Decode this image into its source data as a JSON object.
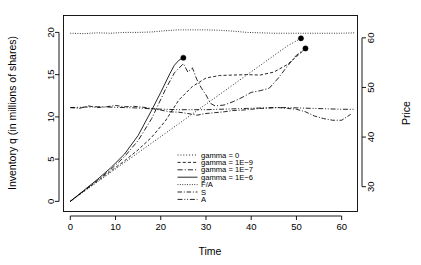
{
  "chart_data": {
    "type": "line",
    "title": "",
    "xlabel": "Time",
    "ylabel": "Inventory q (in millions of shares)",
    "y2label": "Price",
    "xlim": [
      -1.5,
      63.5
    ],
    "ylim": [
      -1.2,
      22.0
    ],
    "y2lim": [
      25.0,
      64.5
    ],
    "xticks": [
      0,
      10,
      20,
      30,
      40,
      50,
      60
    ],
    "yticks": [
      0,
      5,
      10,
      15,
      20
    ],
    "y2ticks": [
      30,
      40,
      50,
      60
    ],
    "grid": false,
    "legend_position": "center",
    "series": [
      {
        "name": "gamma = 0",
        "label": "gamma = 0",
        "axis": "left",
        "style": "dotted",
        "x": [
          0,
          3,
          6,
          9,
          12,
          15,
          18,
          21,
          24,
          27,
          30,
          33,
          36,
          39,
          42,
          45,
          48,
          51
        ],
        "y": [
          0.0,
          1.15,
          2.3,
          3.45,
          4.6,
          5.75,
          6.9,
          8.05,
          9.2,
          10.35,
          11.5,
          12.65,
          13.8,
          14.95,
          16.1,
          17.25,
          18.4,
          19.3
        ],
        "endpoint": [
          51,
          19.3
        ],
        "marker": true
      },
      {
        "name": "gamma = 1E-9",
        "label": "gamma = 1E−9",
        "axis": "left",
        "style": "dashed",
        "x": [
          0,
          3,
          6,
          9,
          12,
          15,
          18,
          21,
          24,
          27,
          30,
          33,
          36,
          39,
          42,
          45,
          48,
          51,
          52
        ],
        "y": [
          0.0,
          1.2,
          2.4,
          3.6,
          4.8,
          6.1,
          7.6,
          9.5,
          12.0,
          13.6,
          14.6,
          14.9,
          14.95,
          15.0,
          14.95,
          15.3,
          16.2,
          17.6,
          18.1
        ],
        "endpoint": [
          52,
          18.1
        ],
        "marker": true
      },
      {
        "name": "gamma = 1E-7",
        "label": "gamma = 1E−7",
        "axis": "left",
        "style": "dashdot",
        "x": [
          0,
          3,
          6,
          9,
          12,
          15,
          18,
          21,
          23,
          25,
          26,
          27,
          28,
          29,
          30,
          31,
          32,
          34,
          36,
          38,
          40,
          42,
          44,
          46,
          48,
          50,
          52
        ],
        "y": [
          0.0,
          1.25,
          2.5,
          3.8,
          5.3,
          7.2,
          9.8,
          13.2,
          15.2,
          16.3,
          15.3,
          15.8,
          14.4,
          13.4,
          12.6,
          11.6,
          11.3,
          11.4,
          11.8,
          12.3,
          12.9,
          13.1,
          13.4,
          14.6,
          16.0,
          17.3,
          18.1
        ],
        "endpoint": [
          52,
          18.1
        ],
        "marker": false
      },
      {
        "name": "gamma = 1E-6",
        "label": "gamma = 1E−6",
        "axis": "left",
        "style": "solid",
        "x": [
          0,
          3,
          6,
          9,
          12,
          15,
          18,
          20,
          22,
          23,
          24,
          25
        ],
        "y": [
          0.0,
          1.3,
          2.6,
          4.0,
          5.6,
          7.8,
          10.8,
          12.9,
          15.1,
          16.1,
          16.7,
          17.0
        ],
        "endpoint": [
          25,
          17.0
        ],
        "marker": true
      },
      {
        "name": "F/A",
        "label": "F/A",
        "axis": "right",
        "style": "finedot",
        "x": [
          0,
          3,
          6,
          9,
          12,
          15,
          18,
          21,
          24,
          27,
          30,
          33,
          36,
          39,
          42,
          45,
          48,
          51,
          54,
          57,
          60,
          63
        ],
        "y": [
          19.9,
          19.85,
          19.95,
          19.9,
          20.0,
          20.0,
          20.05,
          20.2,
          20.3,
          20.3,
          20.3,
          20.25,
          20.15,
          20.0,
          19.95,
          19.9,
          19.9,
          19.9,
          19.9,
          19.9,
          19.9,
          19.95
        ],
        "price": [
          61.1,
          61.0,
          61.2,
          61.1,
          61.3,
          61.3,
          61.4,
          61.6,
          61.8,
          61.8,
          61.8,
          61.7,
          61.5,
          61.3,
          61.2,
          61.1,
          61.1,
          61.1,
          61.1,
          61.1,
          61.1,
          61.2
        ],
        "marker": false
      },
      {
        "name": "S",
        "label": "S",
        "axis": "right",
        "style": "dashdot2",
        "x": [
          0,
          2,
          4,
          6,
          8,
          10,
          12,
          14,
          16,
          18,
          20,
          22,
          24,
          26,
          28,
          30,
          32,
          34,
          36,
          38,
          40,
          42,
          44,
          46,
          48,
          50,
          52,
          54,
          56,
          58,
          60,
          62
        ],
        "y": [
          11.1,
          11.0,
          11.3,
          11.1,
          11.2,
          11.35,
          11.2,
          11.25,
          11.15,
          11.0,
          10.8,
          10.6,
          10.55,
          10.4,
          10.2,
          10.4,
          10.5,
          10.6,
          10.75,
          10.8,
          10.9,
          11.0,
          11.05,
          11.1,
          11.0,
          10.9,
          10.6,
          10.1,
          9.8,
          9.6,
          9.6,
          10.3
        ],
        "price": [
          45.4,
          45.2,
          45.7,
          45.4,
          45.5,
          45.8,
          45.5,
          45.6,
          45.4,
          45.2,
          44.8,
          44.5,
          44.4,
          44.1,
          43.8,
          44.1,
          44.3,
          44.5,
          44.7,
          44.8,
          45.0,
          45.2,
          45.2,
          45.4,
          45.2,
          45.0,
          44.5,
          43.6,
          43.1,
          42.7,
          42.7,
          43.9
        ],
        "marker": false
      },
      {
        "name": "A",
        "label": "A",
        "axis": "right",
        "style": "dashdotdot",
        "x": [
          0,
          3,
          6,
          9,
          12,
          15,
          18,
          21,
          24,
          27,
          30,
          33,
          36,
          39,
          42,
          45,
          48,
          51,
          54,
          57,
          60,
          63
        ],
        "y": [
          11.1,
          11.15,
          11.2,
          11.15,
          11.1,
          11.05,
          10.95,
          10.9,
          10.85,
          10.85,
          10.85,
          10.9,
          10.95,
          11.0,
          11.05,
          11.1,
          11.1,
          11.05,
          11.0,
          10.95,
          10.9,
          10.9
        ],
        "price": [
          45.4,
          45.5,
          45.6,
          45.5,
          45.4,
          45.3,
          45.1,
          45.0,
          44.9,
          44.9,
          44.9,
          45.0,
          45.1,
          45.2,
          45.2,
          45.4,
          45.4,
          45.3,
          45.2,
          45.1,
          45.0,
          45.0
        ],
        "marker": false
      }
    ],
    "markers": [
      {
        "x": 25,
        "y": 17.0,
        "series": "gamma = 1E-6"
      },
      {
        "x": 51,
        "y": 19.3,
        "series": "gamma = 0"
      },
      {
        "x": 52,
        "y": 18.1,
        "series": "gamma = 1E-9"
      }
    ]
  },
  "axes": {
    "x_title": "Time",
    "y_left_title": "Inventory q (in millions of shares)",
    "y_right_title": "Price",
    "x_tick_labels": [
      "0",
      "10",
      "20",
      "30",
      "40",
      "50",
      "60"
    ],
    "y_left_tick_labels": [
      "0",
      "5",
      "10",
      "15",
      "20"
    ],
    "y_right_tick_labels": [
      "30",
      "40",
      "50",
      "60"
    ]
  },
  "legend": {
    "items": [
      {
        "label": "gamma = 0",
        "style": "dotted"
      },
      {
        "label": "gamma = 1E−9",
        "style": "dashed"
      },
      {
        "label": "gamma = 1E−7",
        "style": "dashdot"
      },
      {
        "label": "gamma = 1E−6",
        "style": "solid"
      },
      {
        "label": "F/A",
        "style": "finedot"
      },
      {
        "label": "S",
        "style": "dashdot2"
      },
      {
        "label": "A",
        "style": "dashdotdot"
      }
    ]
  },
  "colors": {
    "foreground": "#000000",
    "background": "#ffffff"
  }
}
